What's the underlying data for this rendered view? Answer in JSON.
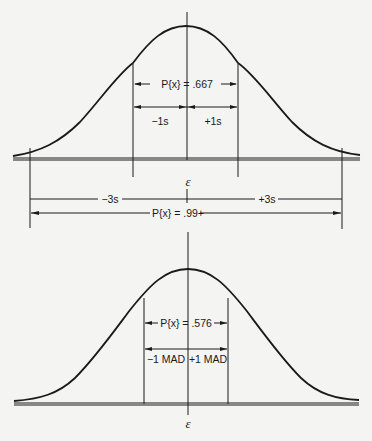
{
  "figure": {
    "top": {
      "title": "Normal distribution with standard deviation intervals",
      "center_label": "ε",
      "inner_prob_label": "P{x} = .667",
      "minus_1s_label": "−1s",
      "plus_1s_label": "+1s",
      "minus_3s_label": "−3s",
      "plus_3s_label": "+3s",
      "outer_prob_label": "P{x} = .99+"
    },
    "bottom": {
      "title": "Normal distribution with mean absolute deviation interval",
      "center_label": "ε",
      "inner_prob_label": "P{x} = .576",
      "minus_mad_label": "−1 MAD",
      "plus_mad_label": "+1 MAD"
    }
  },
  "colors": {
    "background": "#f4f4f2",
    "ink": "#1a1a1a"
  }
}
